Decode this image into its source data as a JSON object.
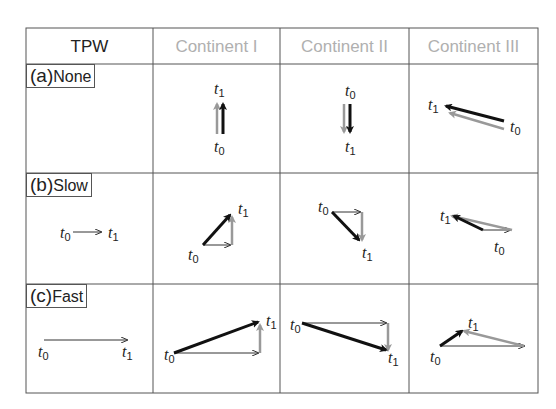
{
  "table": {
    "header": {
      "tpw": "TPW",
      "c1": "Continent I",
      "c2": "Continent II",
      "c3": "Continent III"
    },
    "header_colors": {
      "tpw": "#222222",
      "continents": "#b0b0b0"
    },
    "rows": [
      {
        "prefix": "(a)",
        "label": "None"
      },
      {
        "prefix": "(b)",
        "label": "Slow"
      },
      {
        "prefix": "(c)",
        "label": "Fast"
      }
    ]
  },
  "time": {
    "t": "t",
    "s0": "0",
    "s1": "1"
  },
  "colors": {
    "black_arrow": "#111111",
    "gray_arrow": "#9a9a9a",
    "grid": "#555555"
  }
}
